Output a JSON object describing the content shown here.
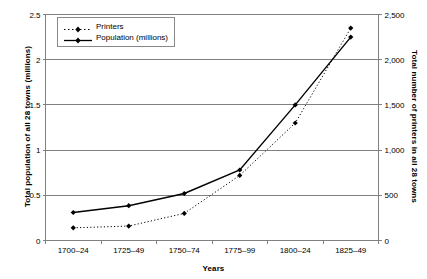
{
  "chart_data": {
    "type": "line",
    "title": "",
    "categories": [
      "1700–24",
      "1725–49",
      "1750–74",
      "1775–99",
      "1800–24",
      "1825–49"
    ],
    "xlabel": "Years",
    "grid": true,
    "legend_position": "top-left",
    "series": [
      {
        "name": "Printers",
        "axis": "right",
        "style": "dotted",
        "marker": "diamond",
        "color": "#000000",
        "values": [
          140,
          160,
          300,
          720,
          1300,
          2350
        ]
      },
      {
        "name": "Population (millions)",
        "axis": "left",
        "style": "solid",
        "marker": "diamond",
        "color": "#000000",
        "values": [
          0.31,
          0.385,
          0.52,
          0.78,
          1.5,
          2.25
        ]
      }
    ],
    "axes": {
      "left": {
        "label": "Total population of all 28 towns (millions)",
        "ticks": [
          "0",
          "0.5",
          "1",
          "1.5",
          "2",
          "2.5"
        ],
        "min": 0,
        "max": 2.5
      },
      "right": {
        "label": "Total number of printers in all 28 towns",
        "ticks": [
          "0",
          "500",
          "1,000",
          "1,500",
          "2,000",
          "2,500"
        ],
        "min": 0,
        "max": 2500
      }
    }
  },
  "legend": {
    "entries": [
      {
        "label": "Printers"
      },
      {
        "label": "Population (millions)"
      }
    ]
  },
  "colors": {
    "line": "#000000",
    "grid": "#808080",
    "axis": "#808080",
    "legend_border": "#888888",
    "background": "#ffffff"
  }
}
